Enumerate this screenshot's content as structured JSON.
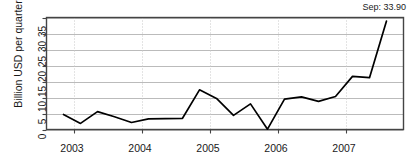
{
  "chart_data": {
    "type": "line",
    "title": "",
    "xlabel": "",
    "ylabel": "Billion USD per quarter",
    "ylim": [
      0,
      35
    ],
    "yticks": [
      0,
      5,
      10,
      15,
      20,
      25,
      30,
      35
    ],
    "xticks": [
      2003,
      2004,
      2005,
      2006,
      2007
    ],
    "xlim": [
      2002.6,
      2007.85
    ],
    "grid": true,
    "legend": "none",
    "annotation": "Sep: 33.90",
    "annotation_value": 33.9,
    "annotation_label": "Sep",
    "line_color": "#000000",
    "gridline_color": "#bbbbbb",
    "axis_color": "#444444",
    "background_color": "#ffffff",
    "x": [
      2002.85,
      2003.1,
      2003.35,
      2003.6,
      2003.85,
      2004.1,
      2004.35,
      2004.6,
      2004.85,
      2005.1,
      2005.35,
      2005.6,
      2005.85,
      2006.1,
      2006.35,
      2006.6,
      2006.85,
      2007.1,
      2007.35,
      2007.6
    ],
    "values": [
      4.7,
      1.9,
      5.6,
      4.0,
      2.2,
      3.3,
      3.4,
      3.5,
      12.4,
      9.7,
      4.4,
      8.0,
      0.1,
      9.5,
      10.2,
      8.8,
      10.3,
      16.6,
      16.2,
      33.9
    ],
    "series": [
      {
        "name": "Quarterly value",
        "values": [
          4.7,
          1.9,
          5.6,
          4.0,
          2.2,
          3.3,
          3.4,
          3.5,
          12.4,
          9.7,
          4.4,
          8.0,
          0.1,
          9.5,
          10.2,
          8.8,
          10.3,
          16.6,
          16.2,
          33.9
        ]
      }
    ]
  },
  "axes": {
    "y_label": "Billion USD per quarter",
    "y_tick_labels": [
      "0",
      "5",
      "10",
      "15",
      "20",
      "25",
      "30",
      "35"
    ],
    "x_tick_labels": [
      "2003",
      "2004",
      "2005",
      "2006",
      "2007"
    ]
  },
  "annotation": {
    "text": "Sep: 33.90"
  }
}
